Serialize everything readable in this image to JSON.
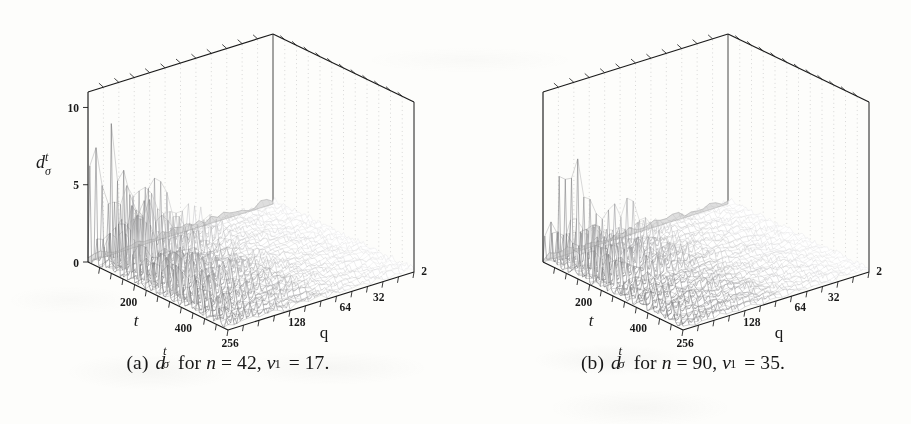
{
  "figure": {
    "kind": "two-panel 3d surface plot figure from a scanned paper",
    "background_color": "#fdfdfb",
    "ink_color": "#1a1a1a",
    "mesh_color": "#8a8a8a"
  },
  "panels": [
    {
      "id": "a",
      "caption": {
        "label": "(a)",
        "quantity_base": "d",
        "quantity_sup": "t",
        "quantity_sub": "σ",
        "for_word": "for",
        "n_name": "n",
        "n_eq": "=",
        "n_value": "42",
        "comma": ",",
        "v_name": "v",
        "v_sub": "1",
        "v_eq": "=",
        "v_value": "17",
        "period": "."
      },
      "axes": {
        "z": {
          "label_base": "d",
          "label_sup": "t",
          "label_sub": "σ",
          "ticks": [
            "0",
            "5",
            "10"
          ],
          "range": [
            0,
            11
          ],
          "shown": true
        },
        "t": {
          "label": "t",
          "ticks": [
            "200",
            "400"
          ],
          "range": [
            0,
            512
          ],
          "minor_tick_count": 12
        },
        "q": {
          "label": "q",
          "ticks": [
            "256",
            "128",
            "64",
            "32",
            "2"
          ],
          "range_note": "decreasing left to right",
          "minor_tick_count": 11
        }
      }
    },
    {
      "id": "b",
      "caption": {
        "label": "(b)",
        "quantity_base": "d",
        "quantity_sup": "t",
        "quantity_sub": "σ",
        "for_word": "for",
        "n_name": "n",
        "n_eq": "=",
        "n_value": "90",
        "comma": ",",
        "v_name": "v",
        "v_sub": "1",
        "v_eq": "=",
        "v_value": "35",
        "period": "."
      },
      "axes": {
        "z": {
          "label_base": "",
          "label_sup": "",
          "label_sub": "",
          "ticks": [],
          "range": [
            0,
            11
          ],
          "shown": false
        },
        "t": {
          "label": "t",
          "ticks": [
            "200",
            "400"
          ],
          "range": [
            0,
            512
          ],
          "minor_tick_count": 12
        },
        "q": {
          "label": "q",
          "ticks": [
            "256",
            "128",
            "64",
            "32",
            "2"
          ],
          "range_note": "decreasing left to right",
          "minor_tick_count": 11
        }
      }
    }
  ],
  "chart_data": [
    {
      "type": "line",
      "panel": "a",
      "title": "d^t_sigma for n = 42, v_1 = 17",
      "xlabel": "t",
      "ylabel": "q",
      "zlabel": "d^t_sigma",
      "projection": "3d-surface-mesh",
      "xlim": [
        0,
        512
      ],
      "zlim": [
        0,
        11
      ],
      "grid": true,
      "legend": "none",
      "x_ticks": [
        "200",
        "400"
      ],
      "y_ticks": [
        "256",
        "128",
        "64",
        "32",
        "2"
      ],
      "z_ticks": [
        "0",
        "5",
        "10"
      ],
      "front_ridge_note": "front-most q slice shows tall sharp spikes decaying with t; back slices are low amplitude noise",
      "front_ridge_peaks": [
        11.0,
        2.1,
        4.4,
        6.1,
        3.0,
        2.6,
        11.0,
        5.0,
        7.4,
        3.4,
        5.9,
        4.1,
        3.0,
        6.4,
        2.7,
        5.2,
        2.1,
        4.7,
        3.5,
        5.6,
        1.9,
        4.2,
        2.4,
        3.7,
        2.0,
        3.1,
        1.6,
        2.8,
        1.5,
        2.4,
        1.3,
        2.1,
        1.2,
        1.8,
        1.1,
        1.6,
        1.0,
        1.4,
        0.9,
        1.2
      ],
      "background_noise_amplitude": [
        0.05,
        0.55
      ]
    },
    {
      "type": "line",
      "panel": "b",
      "title": "d^t_sigma for n = 90, v_1 = 35",
      "xlabel": "t",
      "ylabel": "q",
      "zlabel": "d^t_sigma",
      "projection": "3d-surface-mesh",
      "xlim": [
        0,
        512
      ],
      "zlim": [
        0,
        11
      ],
      "grid": true,
      "legend": "none",
      "x_ticks": [
        "200",
        "400"
      ],
      "y_ticks": [
        "256",
        "128",
        "64",
        "32",
        "2"
      ],
      "z_ticks": [],
      "front_ridge_note": "one dominant spike near small t, then decaying smaller spikes",
      "front_ridge_peaks": [
        2.8,
        1.6,
        3.9,
        2.2,
        9.6,
        2.0,
        3.6,
        1.7,
        2.9,
        1.5,
        4.2,
        2.0,
        3.1,
        1.6,
        4.6,
        2.3,
        2.7,
        1.4,
        3.3,
        1.7,
        2.5,
        1.3,
        2.9,
        1.5,
        2.2,
        1.2,
        2.5,
        1.3,
        1.9,
        1.1,
        2.1,
        1.1,
        1.7,
        1.0,
        1.8,
        0.9,
        1.5,
        0.9,
        1.3,
        0.8
      ],
      "background_noise_amplitude": [
        0.05,
        0.6
      ]
    }
  ]
}
